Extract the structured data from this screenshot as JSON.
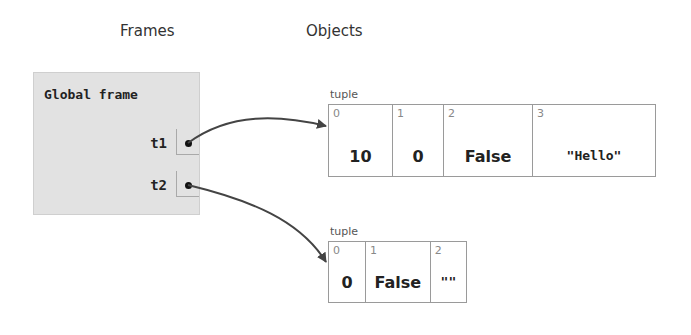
{
  "headings": {
    "frames": "Frames",
    "objects": "Objects"
  },
  "global_frame": {
    "title": "Global frame",
    "variables": [
      {
        "name": "t1",
        "points_to": "tuple-1"
      },
      {
        "name": "t2",
        "points_to": "tuple-2"
      }
    ]
  },
  "objects": [
    {
      "id": "tuple-1",
      "type_label": "tuple",
      "cells": [
        {
          "index": "0",
          "value": "10"
        },
        {
          "index": "1",
          "value": "0"
        },
        {
          "index": "2",
          "value": "False"
        },
        {
          "index": "3",
          "value": "\"Hello\""
        }
      ]
    },
    {
      "id": "tuple-2",
      "type_label": "tuple",
      "cells": [
        {
          "index": "0",
          "value": "0"
        },
        {
          "index": "1",
          "value": "False"
        },
        {
          "index": "2",
          "value": "\"\""
        }
      ]
    }
  ],
  "colors": {
    "frame_bg": "#e2e2e2",
    "arrow": "#444444",
    "border": "#9a9a9a"
  }
}
